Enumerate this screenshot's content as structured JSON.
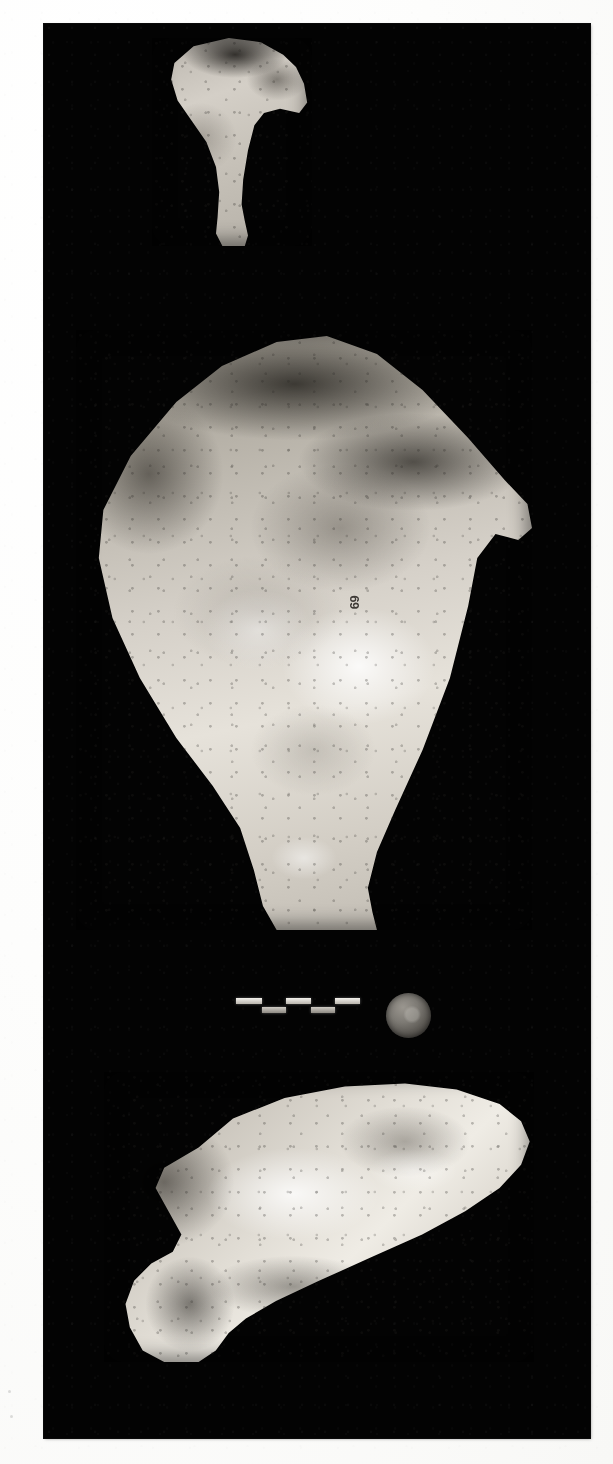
{
  "page": {
    "background_color": "#ffffff",
    "plate_background_color": "#030303"
  },
  "plate": {
    "label": "photographic-plate",
    "specimens": [
      {
        "id": "specimen-a",
        "label": "Small fan-shaped scapula, anterior view",
        "position": "top"
      },
      {
        "id": "specimen-b",
        "label": "Large scapula, blade view",
        "position": "middle",
        "catalog_number": "69"
      },
      {
        "id": "specimen-c",
        "label": "Scapula, lateral view",
        "position": "bottom"
      }
    ]
  },
  "scale_bar": {
    "label": "segmented scale bar",
    "segment_count": 5,
    "segments": [
      {
        "row": "hi",
        "left": 0,
        "width": 26
      },
      {
        "row": "lo",
        "left": 26,
        "width": 24
      },
      {
        "row": "hi",
        "left": 50,
        "width": 25
      },
      {
        "row": "lo",
        "left": 75,
        "width": 24
      },
      {
        "row": "hi",
        "left": 99,
        "width": 25
      }
    ]
  },
  "coin": {
    "label": "coin used as scale reference",
    "shape": "circle"
  },
  "margin_specks": [
    {
      "left": 8,
      "top": 1390,
      "size": 3
    },
    {
      "left": 10,
      "top": 1415,
      "size": 3
    }
  ]
}
